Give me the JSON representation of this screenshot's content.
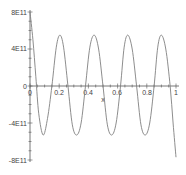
{
  "chart_data": {
    "type": "line",
    "title": "",
    "xlabel": "x",
    "ylabel": "",
    "xlim": [
      0,
      1
    ],
    "ylim": [
      -800000000000.0,
      800000000000.0
    ],
    "grid": false,
    "legend": null,
    "x_ticks": [
      {
        "value": 0,
        "label": "0"
      },
      {
        "value": 0.2,
        "label": "0.2"
      },
      {
        "value": 0.4,
        "label": "0.4"
      },
      {
        "value": 0.6,
        "label": "0.6"
      },
      {
        "value": 0.8,
        "label": "0.8"
      },
      {
        "value": 1,
        "label": "1"
      }
    ],
    "y_ticks": [
      {
        "value": 800000000000.0,
        "label": "8E11"
      },
      {
        "value": 400000000000.0,
        "label": "4E11"
      },
      {
        "value": 0,
        "label": "0"
      },
      {
        "value": -400000000000.0,
        "label": "-4E11"
      },
      {
        "value": -800000000000.0,
        "label": "-8E11"
      }
    ],
    "series": [
      {
        "name": "f(x)",
        "color": "#808080",
        "x": [
          0,
          0.02,
          0.04,
          0.06,
          0.09,
          0.12,
          0.15,
          0.18,
          0.205,
          0.23,
          0.26,
          0.29,
          0.32,
          0.35,
          0.38,
          0.41,
          0.44,
          0.47,
          0.5,
          0.53,
          0.56,
          0.59,
          0.62,
          0.645,
          0.67,
          0.7,
          0.73,
          0.76,
          0.79,
          0.82,
          0.85,
          0.875,
          0.9,
          0.93,
          0.96,
          0.98,
          1.0
        ],
        "y": [
          800000000000.0,
          500000000000.0,
          100000000000.0,
          -300000000000.0,
          -530000000000.0,
          -350000000000.0,
          0,
          420000000000.0,
          550000000000.0,
          420000000000.0,
          0,
          -420000000000.0,
          -530000000000.0,
          -400000000000.0,
          0,
          420000000000.0,
          550000000000.0,
          400000000000.0,
          0,
          -420000000000.0,
          -530000000000.0,
          -400000000000.0,
          0,
          420000000000.0,
          550000000000.0,
          400000000000.0,
          0,
          -420000000000.0,
          -530000000000.0,
          -400000000000.0,
          0,
          420000000000.0,
          550000000000.0,
          400000000000.0,
          0,
          -400000000000.0,
          -770000000000.0
        ]
      }
    ]
  },
  "axes": {
    "x_label": "x",
    "x_tick_labels": [
      "0",
      "0.2",
      "0.4",
      "0.6",
      "0.8",
      "1"
    ],
    "y_tick_labels": [
      "8E11",
      "4E11",
      "0",
      "-4E11",
      "-8E11"
    ]
  }
}
